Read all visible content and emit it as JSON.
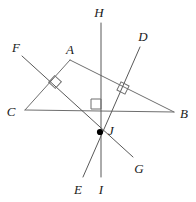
{
  "figure": {
    "background_color": "#ffffff",
    "line_color": "#6e6e6e",
    "label_color": "#1a1a1a",
    "width": 196,
    "height": 202
  },
  "labels": {
    "A": "A",
    "B": "B",
    "C": "C",
    "D": "D",
    "E": "E",
    "F": "F",
    "G": "G",
    "H": "H",
    "I": "I",
    "J": "J"
  },
  "points": [
    {
      "name": "A",
      "label": "A",
      "x": 70,
      "y": 60,
      "label_x": 70,
      "label_y": 49,
      "kind": "triangle-vertex"
    },
    {
      "name": "B",
      "label": "B",
      "x": 174,
      "y": 112,
      "label_x": 184,
      "label_y": 113,
      "kind": "triangle-vertex"
    },
    {
      "name": "C",
      "label": "C",
      "x": 25,
      "y": 110,
      "label_x": 11,
      "label_y": 111,
      "kind": "triangle-vertex"
    },
    {
      "name": "D",
      "label": "D",
      "x": 140,
      "y": 47,
      "label_x": 143,
      "label_y": 36,
      "kind": "ray-endpoint"
    },
    {
      "name": "E",
      "label": "E",
      "x": 83,
      "y": 177,
      "label_x": 78,
      "label_y": 189,
      "kind": "ray-endpoint"
    },
    {
      "name": "F",
      "label": "F",
      "x": 22,
      "y": 56,
      "label_x": 16,
      "label_y": 47,
      "kind": "ray-endpoint"
    },
    {
      "name": "G",
      "label": "G",
      "x": 133,
      "y": 157,
      "label_x": 139,
      "label_y": 168,
      "kind": "ray-endpoint"
    },
    {
      "name": "H",
      "label": "H",
      "x": 101,
      "y": 23,
      "label_x": 99,
      "label_y": 12,
      "kind": "ray-endpoint"
    },
    {
      "name": "I",
      "label": "I",
      "x": 101,
      "y": 177,
      "label_x": 101,
      "label_y": 189,
      "kind": "ray-endpoint"
    },
    {
      "name": "J",
      "label": "J",
      "x": 100,
      "y": 132,
      "label_x": 111,
      "label_y": 130,
      "kind": "concurrency-point"
    }
  ],
  "segments": [
    {
      "name": "side-AB",
      "from": "A",
      "to": "B",
      "x1": 70,
      "y1": 60,
      "x2": 174,
      "y2": 112
    },
    {
      "name": "side-AC",
      "from": "A",
      "to": "C",
      "x1": 70,
      "y1": 60,
      "x2": 25,
      "y2": 110
    },
    {
      "name": "side-CB",
      "from": "C",
      "to": "B",
      "x1": 25,
      "y1": 110,
      "x2": 174,
      "y2": 112
    },
    {
      "name": "line-FG",
      "from": "F",
      "to": "G",
      "x1": 22,
      "y1": 56,
      "x2": 133,
      "y2": 157
    },
    {
      "name": "line-DE",
      "from": "D",
      "to": "E",
      "x1": 140,
      "y1": 47,
      "x2": 83,
      "y2": 177
    },
    {
      "name": "line-HI",
      "from": "H",
      "to": "I",
      "x1": 101,
      "y1": 23,
      "x2": 101,
      "y2": 177
    }
  ],
  "right_angles": [
    {
      "name": "right-angle-on-AC",
      "on_side": "AC",
      "by_line": "FG",
      "x": 55,
      "y": 82,
      "size": 9,
      "rotation": -48
    },
    {
      "name": "right-angle-on-AB",
      "on_side": "AB",
      "by_line": "DE",
      "x": 123,
      "y": 88,
      "size": 9,
      "rotation": 27
    },
    {
      "name": "right-angle-on-CB",
      "on_side": "CB",
      "by_line": "HI",
      "x": 96,
      "y": 104,
      "size": 10,
      "rotation": 0
    }
  ]
}
